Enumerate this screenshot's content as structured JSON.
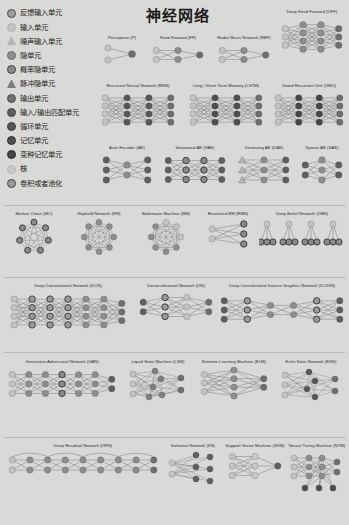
{
  "poster": {
    "title": "神经网络",
    "background_color": "#d9d9d7"
  },
  "legend": {
    "items": [
      {
        "label": "反馈输入单元",
        "icon": "circle-ringed",
        "color": "#9c9c9c",
        "stroke": "#4a4a4a"
      },
      {
        "label": "输入单元",
        "icon": "circle",
        "color": "#c3c3c3",
        "stroke": "#b0b0b0"
      },
      {
        "label": "噪声输入单元",
        "icon": "triangle",
        "color": "#b5b5b5",
        "stroke": "#6d6d6d"
      },
      {
        "label": "隐单元",
        "icon": "circle",
        "color": "#8d8d8d",
        "stroke": "#6a6a6a"
      },
      {
        "label": "概率隐单元",
        "icon": "circle-ringed",
        "color": "#8a8a8a",
        "stroke": "#3f3f3f"
      },
      {
        "label": "脉冲隐单元",
        "icon": "triangle-filled",
        "color": "#7e7e7e",
        "stroke": "#3a3a3a"
      },
      {
        "label": "输出单元",
        "icon": "circle",
        "color": "#6e6e6e",
        "stroke": "#4f4f4f"
      },
      {
        "label": "输入/输出匹配单元",
        "icon": "circle",
        "color": "#5f5f5f",
        "stroke": "#414141"
      },
      {
        "label": "循环单元",
        "icon": "circle",
        "color": "#575757",
        "stroke": "#3a3a3a"
      },
      {
        "label": "记忆单元",
        "icon": "circle",
        "color": "#4e4e4e",
        "stroke": "#313131"
      },
      {
        "label": "变种记忆单元",
        "icon": "circle",
        "color": "#464646",
        "stroke": "#2b2b2b"
      },
      {
        "label": "核",
        "icon": "circle",
        "color": "#c8c8c8",
        "stroke": "#b4b4b4"
      },
      {
        "label": "卷积或者池化",
        "icon": "circle-ringed",
        "color": "#9a9a9a",
        "stroke": "#454545"
      }
    ]
  },
  "networks": [
    {
      "id": "perceptron",
      "caption": "Perceptron (P)"
    },
    {
      "id": "feedforward",
      "caption": "Feed Forward (FF)"
    },
    {
      "id": "rbf",
      "caption": "Radial Basis Network (RBF)"
    },
    {
      "id": "dff",
      "caption": "Deep Feed Forward (DFF)"
    },
    {
      "id": "rnn",
      "caption": "Recurrent Neural Network (RNN)"
    },
    {
      "id": "lstm",
      "caption": "Long / Short Term Memory (LSTM)"
    },
    {
      "id": "gru",
      "caption": "Gated Recurrent Unit (GRU)"
    },
    {
      "id": "ae",
      "caption": "Auto Encoder (AE)"
    },
    {
      "id": "vae",
      "caption": "Variational AE (VAE)"
    },
    {
      "id": "dae",
      "caption": "Denoising AE (DAE)"
    },
    {
      "id": "sae",
      "caption": "Sparse AE (SAE)"
    },
    {
      "id": "mc",
      "caption": "Markov Chain (MC)"
    },
    {
      "id": "hn",
      "caption": "Hopfield Network (HN)"
    },
    {
      "id": "bm",
      "caption": "Boltzmann Machine (BM)"
    },
    {
      "id": "rbm",
      "caption": "Restricted BM (RBM)"
    },
    {
      "id": "dbn",
      "caption": "Deep Belief Network (DBN)"
    },
    {
      "id": "dcn",
      "caption": "Deep Convolutional Network (DCN)"
    },
    {
      "id": "dn",
      "caption": "Deconvolutional Network (DN)"
    },
    {
      "id": "dcign",
      "caption": "Deep Convolutional Inverse Graphics Network (DCIGN)"
    },
    {
      "id": "gan",
      "caption": "Generative Adversarial Network (GAN)"
    },
    {
      "id": "lsm",
      "caption": "Liquid State Machine (LSM)"
    },
    {
      "id": "elm",
      "caption": "Extreme Learning Machine (ELM)"
    },
    {
      "id": "esn",
      "caption": "Echo State Network (ESN)"
    },
    {
      "id": "drn",
      "caption": "Deep Residual Network (DRN)"
    },
    {
      "id": "kn",
      "caption": "Kohonen Network (KN)"
    },
    {
      "id": "svm",
      "caption": "Support Vector Machine (SVM)"
    },
    {
      "id": "ntm",
      "caption": "Neural Turing Machine (NTM)"
    }
  ],
  "palette": {
    "input": "#c3c3c3",
    "noisy_input": "#b5b5b5",
    "hidden": "#8d8d8d",
    "prob_hidden": "#8a8a8a",
    "spiking_hidden": "#7e7e7e",
    "output": "#6e6e6e",
    "match": "#5f5f5f",
    "recurrent": "#575757",
    "memory": "#4e4e4e",
    "different_memory": "#464646",
    "kernel": "#c8c8c8",
    "convolution": "#9a9a9a",
    "edge": "#6f6f6f",
    "ring": "#3c3c3c"
  }
}
